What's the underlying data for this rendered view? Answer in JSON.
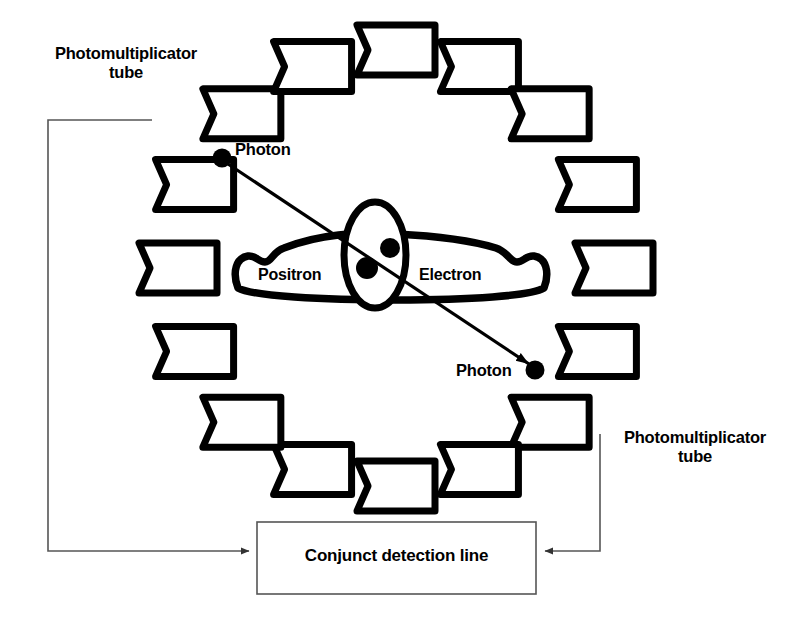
{
  "diagram": {
    "background_color": "#ffffff",
    "stroke_color": "#000000",
    "thin_line_color": "#555555",
    "labels": {
      "pmt_top_left": "Photomultiplicator\ntube",
      "pmt_bottom_right": "Photomultiplicator\ntube",
      "photon_upper": "Photon",
      "photon_lower": "Photon",
      "positron": "Positron",
      "electron": "Electron",
      "conjunct_box": "Conjunct detection line"
    },
    "detector_ring": {
      "count": 16,
      "center_x": 396,
      "center_y": 268,
      "radius": 218,
      "block_width": 78,
      "block_height": 50,
      "notch_depth": 11,
      "stroke_width": 7,
      "fill": "#ffffff",
      "angles_deg": [
        -90,
        -67.5,
        -45,
        -22.5,
        0,
        22.5,
        45,
        67.5,
        90,
        112.5,
        135,
        157.5,
        180,
        202.5,
        225,
        247.5
      ]
    },
    "photons": [
      {
        "name": "photon-upper",
        "x": 222,
        "y": 158,
        "radius": 9
      },
      {
        "name": "photon-lower",
        "x": 535,
        "y": 370,
        "radius": 9
      }
    ],
    "annihilation": {
      "line_of_response": {
        "x1": 222,
        "y1": 158,
        "x2": 535,
        "y2": 370,
        "arrowheads": "both"
      },
      "ellipse": {
        "cx": 375,
        "cy": 255,
        "rx": 31,
        "ry": 53
      },
      "particles": [
        {
          "name": "positron-dot",
          "x": 367,
          "y": 268,
          "radius": 11
        },
        {
          "name": "electron-dot",
          "x": 390,
          "y": 248,
          "radius": 10
        }
      ]
    },
    "conjunct_box": {
      "x": 257,
      "y": 522,
      "width": 279,
      "height": 72
    },
    "connectors": [
      {
        "name": "left-connector",
        "points": "150,120 48,120 48,551 250,551",
        "arrow_at": "end"
      },
      {
        "name": "right-connector",
        "points": "600,434 600,551 543,551",
        "arrow_at": "end"
      }
    ]
  }
}
